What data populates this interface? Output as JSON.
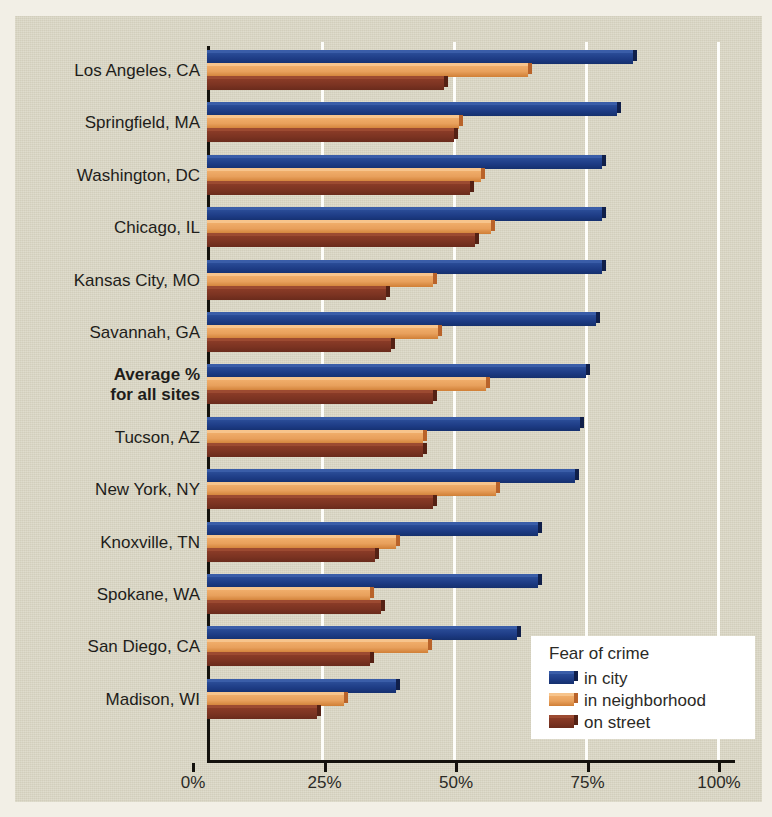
{
  "chart_data": {
    "type": "bar",
    "orientation": "horizontal",
    "title": "",
    "xlabel": "",
    "ylabel": "",
    "xlim": [
      0,
      100
    ],
    "xticks": [
      "0%",
      "25%",
      "50%",
      "75%",
      "100%"
    ],
    "xtick_values": [
      0,
      25,
      50,
      75,
      100
    ],
    "grid": "vertical gridlines at 25%, 50%, 75%, 100%",
    "legend_position": "bottom-right",
    "legend_title": "Fear of crime",
    "categories": [
      "Los Angeles, CA",
      "Springfield, MA",
      "Washington, DC",
      "Chicago, IL",
      "Kansas City, MO",
      "Savannah, GA",
      "Average %\nfor all sites",
      "Tucson, AZ",
      "New York, NY",
      "Knoxville, TN",
      "Spokane, WA",
      "San Diego, CA",
      "Madison, WI"
    ],
    "series": [
      {
        "name": "in city",
        "color": "#1d3b84",
        "values": [
          81,
          78,
          75,
          75,
          75,
          74,
          72,
          71,
          70,
          63,
          63,
          59,
          36
        ]
      },
      {
        "name": "in neighborhood",
        "color": "#e8a05c",
        "values": [
          61,
          48,
          52,
          54,
          43,
          44,
          53,
          41,
          55,
          36,
          31,
          42,
          26
        ]
      },
      {
        "name": "on street",
        "color": "#7c3422",
        "values": [
          45,
          47,
          50,
          51,
          34,
          35,
          43,
          41,
          43,
          32,
          33,
          31,
          21
        ]
      }
    ],
    "highlighted_category": "Average %\nfor all sites"
  },
  "legend": {
    "title": "Fear of crime",
    "items": [
      {
        "label": "in city",
        "key": "city"
      },
      {
        "label": "in neighborhood",
        "key": "nbhd"
      },
      {
        "label": "on street",
        "key": "street"
      }
    ]
  },
  "colors": {
    "background": "#d9d5c3",
    "page": "#f2efe6",
    "axis": "#14120d",
    "gridline": "#fdfdfa",
    "city": "#1d3b84",
    "neighborhood": "#e8a05c",
    "street": "#7c3422",
    "legend_background": "#ffffff",
    "text": "#1e1d1a"
  }
}
